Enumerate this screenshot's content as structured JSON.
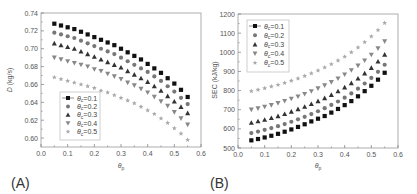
{
  "chart_data": [
    {
      "panel": "(A)",
      "type": "scatter",
      "title": "",
      "xlabel": "θp",
      "ylabel": "D (kg/s)",
      "xlim": [
        0.0,
        0.6
      ],
      "ylim": [
        0.59,
        0.74
      ],
      "xticks": [
        "0.0",
        "0.1",
        "0.2",
        "0.3",
        "0.4",
        "0.5",
        "0.6"
      ],
      "yticks": [
        "0.60",
        "0.62",
        "0.64",
        "0.66",
        "0.68",
        "0.70",
        "0.72",
        "0.74"
      ],
      "grid": false,
      "legend_position": "lower left",
      "x": [
        0.05,
        0.075,
        0.1,
        0.125,
        0.15,
        0.175,
        0.2,
        0.225,
        0.25,
        0.275,
        0.3,
        0.325,
        0.35,
        0.375,
        0.4,
        0.425,
        0.45,
        0.475,
        0.5,
        0.525,
        0.55
      ],
      "series": [
        {
          "name": "θc=0.1",
          "marker": "square",
          "color": "#111111",
          "values": [
            0.728,
            0.726,
            0.724,
            0.722,
            0.719,
            0.716,
            0.713,
            0.71,
            0.707,
            0.704,
            0.7,
            0.696,
            0.692,
            0.688,
            0.683,
            0.678,
            0.673,
            0.667,
            0.661,
            0.654,
            0.646
          ]
        },
        {
          "name": "θc=0.2",
          "marker": "circle",
          "color": "#777777",
          "values": [
            0.718,
            0.716,
            0.714,
            0.712,
            0.709,
            0.706,
            0.703,
            0.7,
            0.697,
            0.694,
            0.69,
            0.686,
            0.682,
            0.678,
            0.674,
            0.669,
            0.664,
            0.658,
            0.652,
            0.645,
            0.638
          ]
        },
        {
          "name": "θc=0.3",
          "marker": "triangle-up",
          "color": "#333333",
          "values": [
            0.706,
            0.704,
            0.702,
            0.7,
            0.697,
            0.694,
            0.691,
            0.688,
            0.685,
            0.682,
            0.679,
            0.675,
            0.671,
            0.667,
            0.663,
            0.658,
            0.653,
            0.647,
            0.641,
            0.635,
            0.628
          ]
        },
        {
          "name": "θc=0.4",
          "marker": "triangle-down",
          "color": "#888888",
          "values": [
            0.69,
            0.688,
            0.686,
            0.684,
            0.682,
            0.68,
            0.677,
            0.675,
            0.672,
            0.669,
            0.666,
            0.662,
            0.659,
            0.655,
            0.651,
            0.646,
            0.641,
            0.636,
            0.629,
            0.622,
            0.615
          ]
        },
        {
          "name": "θc=0.5",
          "marker": "star",
          "color": "#aaaaaa",
          "values": [
            0.668,
            0.666,
            0.664,
            0.662,
            0.66,
            0.658,
            0.656,
            0.653,
            0.651,
            0.648,
            0.645,
            0.642,
            0.639,
            0.635,
            0.631,
            0.627,
            0.622,
            0.617,
            0.611,
            0.605,
            0.598
          ]
        }
      ]
    },
    {
      "panel": "(B)",
      "type": "scatter",
      "title": "",
      "xlabel": "θp",
      "ylabel": "SEC (kJ/kg)",
      "xlim": [
        0.0,
        0.6
      ],
      "ylim": [
        500,
        1200
      ],
      "xticks": [
        "0.0",
        "0.1",
        "0.2",
        "0.3",
        "0.4",
        "0.5",
        "0.6"
      ],
      "yticks": [
        "500",
        "600",
        "700",
        "800",
        "900",
        "1000",
        "1100",
        "1200"
      ],
      "grid": false,
      "legend_position": "upper left",
      "x": [
        0.05,
        0.075,
        0.1,
        0.125,
        0.15,
        0.175,
        0.2,
        0.225,
        0.25,
        0.275,
        0.3,
        0.325,
        0.35,
        0.375,
        0.4,
        0.425,
        0.45,
        0.475,
        0.5,
        0.525,
        0.55
      ],
      "series": [
        {
          "name": "θc=0.1",
          "marker": "square",
          "color": "#111111",
          "values": [
            540,
            547,
            555,
            564,
            574,
            585,
            597,
            610,
            624,
            639,
            653,
            667,
            685,
            704,
            724,
            745,
            770,
            797,
            825,
            857,
            893
          ]
        },
        {
          "name": "θc=0.2",
          "marker": "circle",
          "color": "#777777",
          "values": [
            578,
            586,
            595,
            604,
            614,
            625,
            637,
            650,
            663,
            677,
            692,
            708,
            725,
            743,
            763,
            785,
            810,
            837,
            866,
            898,
            935
          ]
        },
        {
          "name": "θc=0.3",
          "marker": "triangle-up",
          "color": "#333333",
          "values": [
            632,
            640,
            648,
            657,
            667,
            678,
            690,
            703,
            716,
            730,
            745,
            761,
            778,
            797,
            817,
            839,
            863,
            890,
            919,
            952,
            988
          ]
        },
        {
          "name": "θc=0.4",
          "marker": "triangle-down",
          "color": "#888888",
          "values": [
            700,
            707,
            715,
            724,
            734,
            745,
            757,
            769,
            782,
            796,
            811,
            827,
            844,
            863,
            884,
            906,
            930,
            957,
            987,
            1020,
            1057
          ]
        },
        {
          "name": "θc=0.5",
          "marker": "star",
          "color": "#aaaaaa",
          "values": [
            797,
            804,
            812,
            821,
            830,
            840,
            851,
            863,
            876,
            890,
            905,
            921,
            938,
            957,
            977,
            1000,
            1025,
            1053,
            1083,
            1116,
            1153
          ]
        }
      ]
    }
  ],
  "panels": {
    "a": {
      "label": "(A)",
      "ylabel_main": "D",
      "ylabel_unit": " (kg/s)",
      "xlabel_main": "θ",
      "xlabel_sub": "p"
    },
    "b": {
      "label": "(B)",
      "ylabel_main": "SEC (kJ/kg)",
      "xlabel_main": "θ",
      "xlabel_sub": "p"
    }
  },
  "legend": {
    "prefix": "θ",
    "sub": "c",
    "values": [
      "=0.1",
      "=0.2",
      "=0.3",
      "=0.4",
      "=0.5"
    ]
  },
  "colors": {
    "axis": "#7a7a7a",
    "frame": "#9a9a9a"
  }
}
